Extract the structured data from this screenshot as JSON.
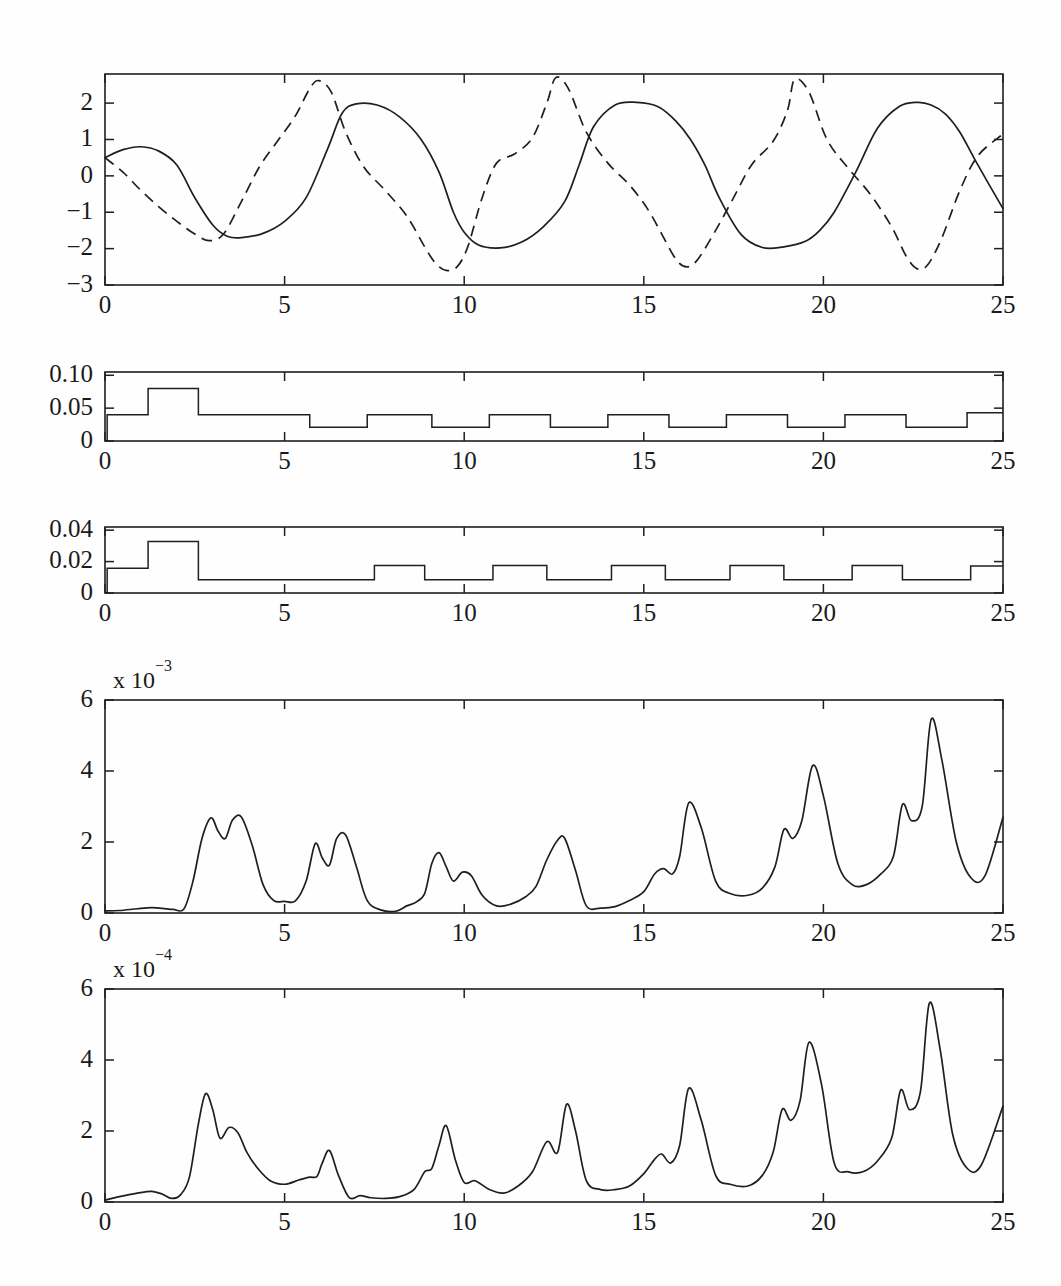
{
  "figure": {
    "panel_count": 5,
    "background_color": "#fefefe",
    "line_color": "#1f1f1f"
  },
  "chart_data": [
    {
      "type": "line",
      "panel_index": 1,
      "title": "",
      "xlabel": "",
      "ylabel": "",
      "xlim": [
        0,
        25
      ],
      "ylim": [
        -3,
        2.8
      ],
      "xticks": [
        0,
        5,
        10,
        15,
        20,
        25
      ],
      "xtick_labels": [
        "0",
        "5",
        "10",
        "15",
        "20",
        "25"
      ],
      "yticks": [
        -3,
        -2,
        -1,
        0,
        1,
        2
      ],
      "ytick_labels": [
        "−3",
        "−2",
        "−1",
        "0",
        "1",
        "2"
      ],
      "grid": false,
      "legend": "none",
      "series": [
        {
          "name": "solid",
          "style": "solid",
          "x": [
            0,
            0.5,
            1.0,
            1.5,
            2.0,
            2.5,
            3.0,
            3.4,
            3.8,
            4.4,
            5.0,
            5.6,
            6.2,
            6.6,
            7.0,
            7.6,
            8.2,
            8.8,
            9.3,
            9.7,
            10.0,
            10.4,
            11.0,
            11.6,
            12.2,
            12.8,
            13.2,
            13.6,
            14.2,
            14.8,
            15.4,
            15.9,
            16.3,
            16.7,
            17.1,
            17.7,
            18.3,
            18.9,
            19.5,
            19.9,
            20.3,
            20.9,
            21.5,
            22.1,
            22.6,
            23.0,
            23.4,
            23.8,
            24.3,
            25.0
          ],
          "y": [
            0.5,
            0.72,
            0.8,
            0.68,
            0.3,
            -0.6,
            -1.35,
            -1.66,
            -1.7,
            -1.58,
            -1.25,
            -0.6,
            0.75,
            1.72,
            1.98,
            1.94,
            1.62,
            1.0,
            0.1,
            -1.0,
            -1.55,
            -1.9,
            -1.98,
            -1.82,
            -1.4,
            -0.7,
            0.3,
            1.35,
            1.95,
            2.02,
            1.9,
            1.5,
            1.0,
            0.3,
            -0.6,
            -1.6,
            -1.97,
            -1.95,
            -1.8,
            -1.5,
            -1.0,
            0.1,
            1.3,
            1.9,
            2.02,
            1.95,
            1.7,
            1.2,
            0.3,
            -0.9
          ]
        },
        {
          "name": "dashed",
          "style": "dashed",
          "x": [
            0,
            0.5,
            1.0,
            1.5,
            2.0,
            2.5,
            2.9,
            3.3,
            3.8,
            4.3,
            4.8,
            5.3,
            5.7,
            5.95,
            6.3,
            6.7,
            7.2,
            7.8,
            8.4,
            8.9,
            9.2,
            9.5,
            9.8,
            10.1,
            10.5,
            10.9,
            11.4,
            11.9,
            12.3,
            12.55,
            12.9,
            13.4,
            14.0,
            14.6,
            15.1,
            15.5,
            15.9,
            16.2,
            16.5,
            17.0,
            17.5,
            18.0,
            18.6,
            19.0,
            19.2,
            19.6,
            20.1,
            20.7,
            21.3,
            21.9,
            22.3,
            22.6,
            22.9,
            23.3,
            23.8,
            24.3,
            25.0
          ],
          "y": [
            0.5,
            0.1,
            -0.4,
            -0.85,
            -1.25,
            -1.6,
            -1.78,
            -1.6,
            -0.7,
            0.25,
            0.95,
            1.65,
            2.4,
            2.62,
            2.3,
            1.2,
            0.25,
            -0.4,
            -1.1,
            -1.95,
            -2.4,
            -2.6,
            -2.5,
            -1.95,
            -0.6,
            0.35,
            0.6,
            1.05,
            2.0,
            2.7,
            2.4,
            1.2,
            0.35,
            -0.25,
            -0.9,
            -1.6,
            -2.3,
            -2.5,
            -2.3,
            -1.5,
            -0.6,
            0.3,
            0.95,
            1.8,
            2.65,
            2.3,
            1.0,
            0.2,
            -0.5,
            -1.4,
            -2.2,
            -2.55,
            -2.45,
            -1.7,
            -0.4,
            0.55,
            1.15
          ]
        }
      ]
    },
    {
      "type": "line",
      "panel_index": 2,
      "subtype": "step",
      "title": "",
      "xlabel": "",
      "ylabel": "",
      "xlim": [
        0,
        25
      ],
      "ylim": [
        0,
        0.105
      ],
      "xticks": [
        0,
        5,
        10,
        15,
        20,
        25
      ],
      "xtick_labels": [
        "0",
        "5",
        "10",
        "15",
        "20",
        "25"
      ],
      "yticks": [
        0,
        0.05,
        0.1
      ],
      "ytick_labels": [
        "0",
        "0.05",
        "0.10"
      ],
      "grid": false,
      "legend": "none",
      "series": [
        {
          "name": "step-signal",
          "style": "step",
          "x": [
            0,
            0.06,
            1.2,
            2.6,
            5.7,
            7.3,
            9.1,
            10.7,
            12.4,
            14.0,
            15.7,
            17.3,
            19.0,
            20.6,
            22.3,
            24.0,
            25.0
          ],
          "y": [
            0.0,
            0.04,
            0.08,
            0.04,
            0.021,
            0.04,
            0.021,
            0.04,
            0.021,
            0.04,
            0.021,
            0.04,
            0.021,
            0.04,
            0.021,
            0.043,
            0.043
          ]
        }
      ]
    },
    {
      "type": "line",
      "panel_index": 3,
      "subtype": "step",
      "title": "",
      "xlabel": "",
      "ylabel": "",
      "xlim": [
        0,
        25
      ],
      "ylim": [
        0,
        0.042
      ],
      "xticks": [
        0,
        5,
        10,
        15,
        20,
        25
      ],
      "xtick_labels": [
        "0",
        "5",
        "10",
        "15",
        "20",
        "25"
      ],
      "yticks": [
        0,
        0.02,
        0.04
      ],
      "ytick_labels": [
        "0",
        "0.02",
        "0.04"
      ],
      "grid": false,
      "legend": "none",
      "series": [
        {
          "name": "step-signal",
          "style": "step",
          "x": [
            0,
            0.06,
            1.2,
            2.6,
            7.5,
            8.9,
            10.8,
            12.3,
            14.1,
            15.6,
            17.4,
            18.9,
            20.8,
            22.2,
            24.1,
            25.0
          ],
          "y": [
            0.0,
            0.0158,
            0.0328,
            0.0085,
            0.0175,
            0.0085,
            0.0175,
            0.0085,
            0.0175,
            0.0085,
            0.0175,
            0.0085,
            0.0175,
            0.0085,
            0.0172,
            0.0172
          ]
        }
      ]
    },
    {
      "type": "line",
      "panel_index": 4,
      "title": "",
      "xlabel": "",
      "ylabel": "",
      "y_multiplier_label": "x 10",
      "y_multiplier_exponent": "−3",
      "xlim": [
        0,
        25
      ],
      "ylim": [
        0,
        6
      ],
      "xticks": [
        0,
        5,
        10,
        15,
        20,
        25
      ],
      "xtick_labels": [
        "0",
        "5",
        "10",
        "15",
        "20",
        "25"
      ],
      "yticks": [
        0,
        2,
        4,
        6
      ],
      "ytick_labels": [
        "0",
        "2",
        "4",
        "6"
      ],
      "grid": false,
      "legend": "none",
      "series": [
        {
          "name": "error-signal",
          "style": "solid",
          "x": [
            0.0,
            0.4,
            0.9,
            1.3,
            1.6,
            1.9,
            2.2,
            2.45,
            2.7,
            2.95,
            3.15,
            3.35,
            3.55,
            3.8,
            4.1,
            4.4,
            4.7,
            5.0,
            5.3,
            5.6,
            5.85,
            6.05,
            6.25,
            6.45,
            6.7,
            7.0,
            7.3,
            7.7,
            8.1,
            8.4,
            8.65,
            8.9,
            9.1,
            9.3,
            9.5,
            9.7,
            9.95,
            10.2,
            10.5,
            10.9,
            11.3,
            11.7,
            12.0,
            12.3,
            12.6,
            12.8,
            13.1,
            13.4,
            13.8,
            14.2,
            14.6,
            15.0,
            15.3,
            15.55,
            15.8,
            16.0,
            16.25,
            16.6,
            17.0,
            17.4,
            17.9,
            18.3,
            18.65,
            18.9,
            19.15,
            19.4,
            19.7,
            20.0,
            20.4,
            20.8,
            21.2,
            21.6,
            21.95,
            22.2,
            22.45,
            22.75,
            23.0,
            23.3,
            23.7,
            24.1,
            24.5,
            25.0
          ],
          "y": [
            0.06,
            0.07,
            0.12,
            0.15,
            0.13,
            0.1,
            0.12,
            0.9,
            2.1,
            2.68,
            2.3,
            2.1,
            2.62,
            2.7,
            1.9,
            0.8,
            0.35,
            0.33,
            0.34,
            0.9,
            1.95,
            1.55,
            1.35,
            2.1,
            2.2,
            1.3,
            0.35,
            0.08,
            0.05,
            0.2,
            0.3,
            0.55,
            1.4,
            1.7,
            1.3,
            0.9,
            1.15,
            1.05,
            0.5,
            0.2,
            0.25,
            0.45,
            0.75,
            1.5,
            2.05,
            2.1,
            1.2,
            0.2,
            0.14,
            0.18,
            0.35,
            0.6,
            1.1,
            1.25,
            1.1,
            1.6,
            3.1,
            2.4,
            0.9,
            0.55,
            0.5,
            0.7,
            1.3,
            2.35,
            2.1,
            2.6,
            4.15,
            3.3,
            1.4,
            0.8,
            0.8,
            1.1,
            1.6,
            3.05,
            2.6,
            3.0,
            5.45,
            4.3,
            2.0,
            1.0,
            1.05,
            2.7
          ]
        }
      ]
    },
    {
      "type": "line",
      "panel_index": 5,
      "title": "",
      "xlabel": "",
      "ylabel": "",
      "y_multiplier_label": "x 10",
      "y_multiplier_exponent": "−4",
      "xlim": [
        0,
        25
      ],
      "ylim": [
        0,
        6
      ],
      "xticks": [
        0,
        5,
        10,
        15,
        20,
        25
      ],
      "xtick_labels": [
        "0",
        "5",
        "10",
        "15",
        "20",
        "25"
      ],
      "yticks": [
        0,
        2,
        4,
        6
      ],
      "ytick_labels": [
        "0",
        "2",
        "4",
        "6"
      ],
      "grid": false,
      "legend": "none",
      "series": [
        {
          "name": "error-signal",
          "style": "solid",
          "x": [
            0.0,
            0.4,
            0.9,
            1.3,
            1.6,
            1.85,
            2.1,
            2.35,
            2.6,
            2.8,
            3.0,
            3.2,
            3.45,
            3.7,
            3.95,
            4.25,
            4.6,
            5.0,
            5.4,
            5.7,
            5.9,
            6.05,
            6.25,
            6.5,
            6.8,
            7.1,
            7.4,
            7.8,
            8.2,
            8.6,
            8.9,
            9.1,
            9.3,
            9.5,
            9.75,
            10.0,
            10.3,
            10.7,
            11.1,
            11.5,
            11.9,
            12.3,
            12.6,
            12.85,
            13.1,
            13.4,
            13.8,
            14.2,
            14.6,
            15.0,
            15.3,
            15.5,
            15.75,
            16.0,
            16.25,
            16.6,
            17.0,
            17.4,
            17.9,
            18.3,
            18.6,
            18.85,
            19.1,
            19.35,
            19.6,
            19.95,
            20.3,
            20.7,
            21.1,
            21.5,
            21.9,
            22.15,
            22.4,
            22.7,
            22.95,
            23.25,
            23.6,
            24.0,
            24.4,
            25.0
          ],
          "y": [
            0.05,
            0.15,
            0.25,
            0.3,
            0.22,
            0.1,
            0.2,
            0.7,
            2.2,
            3.05,
            2.6,
            1.8,
            2.1,
            1.95,
            1.4,
            0.95,
            0.6,
            0.5,
            0.62,
            0.7,
            0.72,
            1.1,
            1.45,
            0.75,
            0.12,
            0.18,
            0.12,
            0.1,
            0.15,
            0.35,
            0.85,
            0.95,
            1.6,
            2.15,
            1.2,
            0.55,
            0.6,
            0.35,
            0.25,
            0.45,
            0.85,
            1.7,
            1.4,
            2.75,
            2.0,
            0.6,
            0.35,
            0.35,
            0.45,
            0.8,
            1.2,
            1.35,
            1.1,
            1.6,
            3.2,
            2.3,
            0.75,
            0.5,
            0.45,
            0.75,
            1.4,
            2.6,
            2.3,
            2.85,
            4.5,
            3.3,
            1.1,
            0.85,
            0.85,
            1.15,
            1.8,
            3.15,
            2.6,
            3.1,
            5.6,
            4.3,
            1.9,
            0.95,
            1.05,
            2.7
          ]
        }
      ]
    }
  ]
}
